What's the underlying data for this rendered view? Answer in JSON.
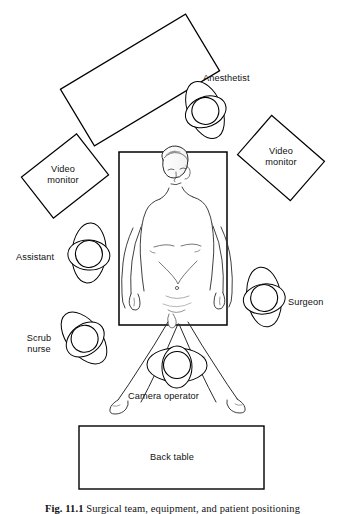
{
  "figure": {
    "domain": "anatomical-diagram",
    "caption_label": "Fig. 11.1",
    "caption_text": "Surgical team, equipment, and patient positioning"
  },
  "labels": {
    "anesthetist": "Anesthetist",
    "video_monitor_left": "Video\nmonitor",
    "video_monitor_right": "Video\nmonitor",
    "assistant": "Assistant",
    "surgeon": "Surgeon",
    "scrub_nurse": "Scrub\nnurse",
    "camera_operator": "Camera operator",
    "back_table": "Back table"
  },
  "elements": {
    "anesthesia_cart": {
      "name": "anesthesia-cart",
      "label": "",
      "shape": "rotated-rectangle",
      "rotation_deg": -31
    },
    "operating_table": {
      "name": "operating-table",
      "label": "",
      "shape": "rectangle"
    },
    "back_table": {
      "name": "back-table",
      "label": "Back table",
      "shape": "rectangle"
    },
    "video_monitor_left": {
      "name": "video-monitor-left",
      "shape": "rotated-rectangle",
      "rotation_deg": -38
    },
    "video_monitor_right": {
      "name": "video-monitor-right",
      "shape": "rotated-rectangle",
      "rotation_deg": 41
    }
  },
  "staff": [
    {
      "role": "Anesthetist",
      "position": "head of table, upper right"
    },
    {
      "role": "Assistant",
      "position": "patient left side"
    },
    {
      "role": "Surgeon",
      "position": "patient right side"
    },
    {
      "role": "Scrub nurse",
      "position": "lower left"
    },
    {
      "role": "Camera operator",
      "position": "between the legs, foot of table"
    }
  ],
  "colors": {
    "ink": "#1a1a1a",
    "line": "#000000",
    "paper": "#ffffff",
    "shade": "#9a9a9a"
  }
}
